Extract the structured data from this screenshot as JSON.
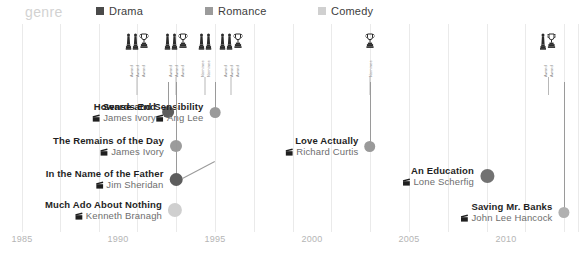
{
  "legend": {
    "title": "genre",
    "entries": [
      {
        "label": "Drama",
        "color": "#4a4a4a",
        "x": 96
      },
      {
        "label": "Romance",
        "color": "#9b9b9b",
        "x": 205
      },
      {
        "label": "Comedy",
        "color": "#d0d0d0",
        "x": 318
      }
    ]
  },
  "axis": {
    "ticks": [
      {
        "label": "1985",
        "x": 22
      },
      {
        "label": "1990",
        "x": 118
      },
      {
        "label": "1995",
        "x": 215
      },
      {
        "label": "2000",
        "x": 312
      },
      {
        "label": "2005",
        "x": 409
      },
      {
        "label": "2010",
        "x": 506
      }
    ],
    "gridlines": [
      22,
      60,
      99,
      137,
      176,
      215,
      254,
      293,
      331,
      370,
      409,
      448,
      487,
      525,
      564,
      578
    ]
  },
  "award_groups": [
    {
      "x": 137,
      "icons": [
        "oscar-statuette",
        "oscar-statuette",
        "trophy-cup"
      ],
      "labels": [
        "Award",
        "Award",
        "Award"
      ],
      "stem_height": 18
    },
    {
      "x": 176,
      "icons": [
        "oscar-statuette",
        "oscar-statuette",
        "trophy-cup"
      ],
      "labels": [
        "Award",
        "Award",
        "Award"
      ],
      "stem_height": 18
    },
    {
      "x": 205,
      "icons": [
        "oscar-statuette",
        "oscar-statuette"
      ],
      "labels": [
        "Nominee",
        "Nominee"
      ],
      "stem_height": 18
    },
    {
      "x": 231,
      "icons": [
        "oscar-statuette",
        "oscar-statuette",
        "trophy-cup"
      ],
      "labels": [
        "Award",
        "Award",
        "Award"
      ],
      "stem_height": 18
    },
    {
      "x": 370,
      "icons": [
        "trophy-cup"
      ],
      "labels": [
        "Nominee"
      ],
      "stem_height": 18
    },
    {
      "x": 548,
      "icons": [
        "oscar-statuette",
        "trophy-cup"
      ],
      "labels": [
        "Award",
        "Award"
      ],
      "stem_height": 18
    }
  ],
  "chart_data": {
    "type": "scatter",
    "title": "genre",
    "xlabel": "",
    "ylabel": "",
    "xlim": [
      1985,
      2012
    ],
    "grid": true,
    "legend_position": "top",
    "categories": [
      "Drama",
      "Romance",
      "Comedy"
    ],
    "films": [
      {
        "title": "Howards End",
        "director": "James Ivory",
        "year": 1992,
        "genre": "Drama",
        "color": "#5d5d5d",
        "dot_x": 168,
        "dot_y": 88,
        "dot_size": 12,
        "connector_top": 0
      },
      {
        "title": "Sense and Sensibility",
        "director": "Ang Lee",
        "year": 1995,
        "genre": "Romance",
        "color": "#9a9a9a",
        "dot_x": 215,
        "dot_y": 88,
        "dot_size": 11,
        "connector_top": 0
      },
      {
        "title": "The Remains of the Day",
        "director": "James Ivory",
        "year": 1993,
        "genre": "Romance",
        "color": "#9c9c9c",
        "dot_x": 176,
        "dot_y": 122,
        "dot_size": 12,
        "connector_top": 0
      },
      {
        "title": "In the Name of the Father",
        "director": "Jim Sheridan",
        "year": 1993,
        "genre": "Drama",
        "color": "#5d5d5d",
        "dot_x": 176,
        "dot_y": 155,
        "dot_size": 13,
        "connector_top": 0
      },
      {
        "title": "Much Ado About Nothing",
        "director": "Kenneth Branagh",
        "year": 1993,
        "genre": "Comedy",
        "color": "#cfcfcf",
        "dot_x": 175,
        "dot_y": 186,
        "dot_size": 14,
        "connector_top": -1
      },
      {
        "title": "Love Actually",
        "director": "Richard Curtis",
        "year": 2003,
        "genre": "Romance",
        "color": "#9a9a9a",
        "dot_x": 370,
        "dot_y": 122,
        "dot_size": 11,
        "connector_top": 0
      },
      {
        "title": "An Education",
        "director": "Lone Scherfig",
        "year": 2009,
        "genre": "Drama",
        "color": "#727272",
        "dot_x": 487,
        "dot_y": 152,
        "dot_size": 14,
        "connector_top": -1
      },
      {
        "title": "Saving Mr. Banks",
        "director": "John Lee Hancock",
        "year": 2013,
        "genre": "Romance",
        "color": "#b0b0b0",
        "dot_x": 564,
        "dot_y": 188,
        "dot_size": 11,
        "connector_top": 0
      }
    ]
  }
}
